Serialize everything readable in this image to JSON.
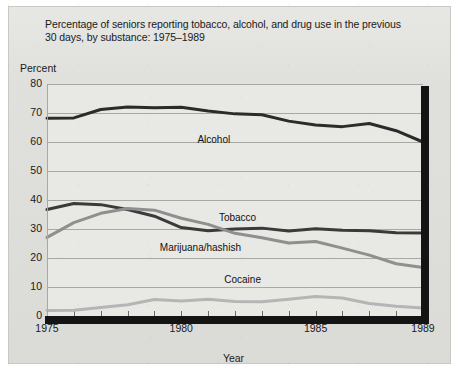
{
  "chart_data": {
    "type": "line",
    "title": "Percentage of seniors reporting tobacco, alcohol, and drug use in the previous 30 days, by substance: 1975–1989",
    "ylabel": "Percent",
    "xlabel": "Year",
    "ylim": [
      0,
      80
    ],
    "xlim": [
      1975,
      1989
    ],
    "grid": true,
    "legend_position": "inline-labels",
    "ytick_labels": [
      "0",
      "10",
      "20",
      "30",
      "40",
      "50",
      "60",
      "70",
      "80"
    ],
    "ytick_values": [
      0,
      10,
      20,
      30,
      40,
      50,
      60,
      70,
      80
    ],
    "xtick_labels": [
      "1975",
      "1980",
      "1985",
      "1989"
    ],
    "xtick_values": [
      1975,
      1980,
      1985,
      1989
    ],
    "x": [
      1975,
      1976,
      1977,
      1978,
      1979,
      1980,
      1981,
      1982,
      1983,
      1984,
      1985,
      1986,
      1987,
      1988,
      1989
    ],
    "series": [
      {
        "name": "Alcohol",
        "color": "#2b2b2b",
        "width": 3.0,
        "values": [
          68.2,
          68.3,
          71.2,
          72.1,
          71.8,
          72.0,
          70.7,
          69.7,
          69.4,
          67.2,
          65.9,
          65.3,
          66.4,
          63.9,
          60.0
        ],
        "label_x": 1980.6,
        "label_y": 60.5
      },
      {
        "name": "Tobacco",
        "color": "#3a3a3a",
        "width": 3.0,
        "values": [
          36.7,
          38.8,
          38.4,
          36.7,
          34.4,
          30.5,
          29.4,
          30.0,
          30.3,
          29.3,
          30.1,
          29.6,
          29.4,
          28.7,
          28.6
        ],
        "label_x": 1981.4,
        "label_y": 33.5
      },
      {
        "name": "Marijuana/hashish",
        "color": "#8f8f8f",
        "width": 3.0,
        "values": [
          27.1,
          32.2,
          35.4,
          37.1,
          36.5,
          33.7,
          31.6,
          28.5,
          27.0,
          25.2,
          25.7,
          23.4,
          21.0,
          18.0,
          16.7
        ],
        "label_x": 1979.2,
        "label_y": 23.0
      },
      {
        "name": "Cocaine",
        "color": "#b5b5b5",
        "width": 3.0,
        "values": [
          1.9,
          2.0,
          2.9,
          3.9,
          5.7,
          5.2,
          5.8,
          5.0,
          4.9,
          5.8,
          6.7,
          6.2,
          4.3,
          3.4,
          2.8
        ],
        "label_x": 1981.6,
        "label_y": 12.0
      }
    ]
  }
}
